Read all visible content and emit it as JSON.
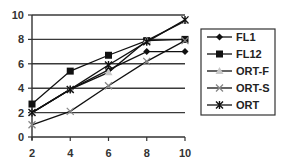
{
  "chart_data": {
    "type": "line",
    "title": "",
    "xlabel": "",
    "ylabel": "",
    "x": [
      2,
      4,
      6,
      8,
      10
    ],
    "xlim": [
      2,
      10
    ],
    "ylim": [
      0,
      10
    ],
    "x_ticks": [
      "2",
      "4",
      "6",
      "8",
      "10"
    ],
    "y_ticks": [
      "0",
      "2",
      "4",
      "6",
      "8",
      "10"
    ],
    "grid": "horizontal",
    "legend_position": "right",
    "series": [
      {
        "name": "FL1",
        "marker": "diamond",
        "color": "#111111",
        "values": [
          2.0,
          3.9,
          5.5,
          7.0,
          7.0
        ]
      },
      {
        "name": "FL12",
        "marker": "square",
        "color": "#111111",
        "values": [
          2.7,
          5.4,
          6.7,
          7.9,
          8.0
        ]
      },
      {
        "name": "ORT-F",
        "marker": "triangle",
        "color": "#111111",
        "marker_color": "#c8c8c8",
        "values": [
          2.0,
          3.9,
          5.3,
          7.9,
          9.5
        ]
      },
      {
        "name": "ORT-S",
        "marker": "x",
        "color": "#111111",
        "marker_color": "#888888",
        "values": [
          1.0,
          2.1,
          4.2,
          6.2,
          7.9
        ]
      },
      {
        "name": "ORT",
        "marker": "star",
        "color": "#111111",
        "values": [
          2.0,
          3.9,
          5.9,
          7.8,
          9.6
        ]
      }
    ]
  }
}
